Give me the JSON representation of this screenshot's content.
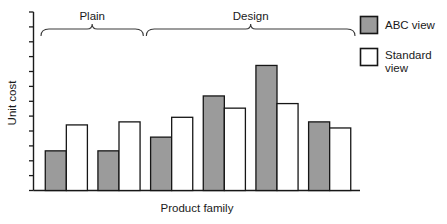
{
  "chart_data": {
    "type": "bar",
    "title": "",
    "xlabel": "Product family",
    "ylabel": "Unit cost",
    "grid": false,
    "legend_position": "right",
    "axis": {
      "y_ticks_count": 13,
      "y_tick_labels": [],
      "x_tick_labels": [],
      "ylim": [
        0,
        100
      ],
      "y_axis_note": "unlabeled tick marks only"
    },
    "categories": [
      "1",
      "2",
      "3",
      "4",
      "5",
      "6"
    ],
    "group_brackets": [
      {
        "label": "Plain",
        "categories": [
          "1",
          "2"
        ]
      },
      {
        "label": "Design",
        "categories": [
          "3",
          "4",
          "5",
          "6"
        ]
      }
    ],
    "series": [
      {
        "name": "ABC view",
        "color": "#9b9b9b",
        "values": [
          26,
          26,
          35,
          62,
          82,
          45
        ]
      },
      {
        "name": "Standard view",
        "color": "#ffffff",
        "values": [
          43,
          45,
          48,
          54,
          57,
          41
        ]
      }
    ]
  },
  "legend": {
    "items": [
      {
        "label": "ABC view",
        "swatch": "filled-gray-square"
      },
      {
        "label": "Standard view",
        "swatch": "empty-white-square"
      }
    ]
  },
  "labels": {
    "y_axis": "Unit cost",
    "x_axis": "Product family",
    "group_plain": "Plain",
    "group_design": "Design"
  },
  "colors": {
    "abc_fill": "#9b9b9b",
    "standard_fill": "#ffffff",
    "outline": "#161616",
    "bracket": "#3a3a3a",
    "background": "#ffffff"
  }
}
